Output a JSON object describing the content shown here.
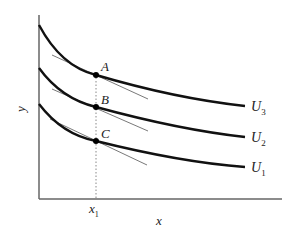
{
  "diagram": {
    "axes": {
      "x_label": "x",
      "y_label": "y",
      "x_tick": "x",
      "x_tick_sub": "1"
    },
    "curves": [
      {
        "name": "U",
        "sub": "3"
      },
      {
        "name": "U",
        "sub": "2"
      },
      {
        "name": "U",
        "sub": "1"
      }
    ],
    "points": [
      "A",
      "B",
      "C"
    ],
    "colors": {
      "curve": "#111111",
      "axis": "#555555",
      "tangent": "#444444",
      "guide": "#777777"
    }
  }
}
